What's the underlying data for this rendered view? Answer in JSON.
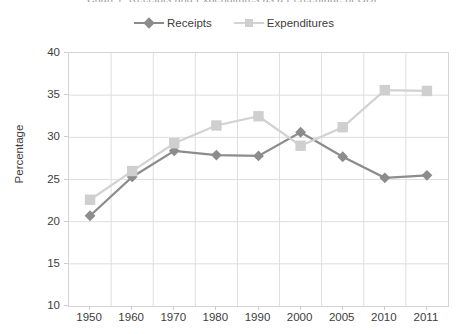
{
  "chart_data": {
    "type": "line",
    "title": "Chart 1: Receipts and Expenditures as a Percentage of GDP",
    "xlabel": "",
    "ylabel": "Percentage",
    "categories": [
      "1950",
      "1960",
      "1970",
      "1980",
      "1990",
      "2000",
      "2005",
      "2010",
      "2011"
    ],
    "ylim": [
      10,
      40
    ],
    "yticks": [
      "10",
      "15",
      "20",
      "25",
      "30",
      "35",
      "40"
    ],
    "grid": true,
    "legend_position": "top-center",
    "series": [
      {
        "name": "Receipts",
        "color": "#8c8c8c",
        "marker": "diamond",
        "values": [
          20.7,
          25.3,
          28.4,
          27.9,
          27.8,
          30.6,
          27.7,
          25.2,
          25.5
        ]
      },
      {
        "name": "Expenditures",
        "color": "#d2d2d2",
        "marker": "square",
        "values": [
          22.6,
          26.0,
          29.3,
          31.4,
          32.5,
          29.0,
          31.2,
          35.6,
          35.5
        ]
      }
    ]
  },
  "legend": {
    "entries": [
      {
        "label": "Receipts"
      },
      {
        "label": "Expenditures"
      }
    ]
  },
  "axes": {
    "y_title": "Percentage"
  }
}
